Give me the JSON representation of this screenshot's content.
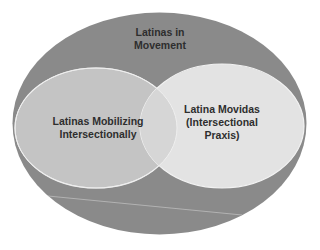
{
  "diagram": {
    "type": "nested-venn",
    "outer": {
      "lines": [
        "Latinas in",
        "Movement"
      ],
      "fill": "#8a8a8a"
    },
    "left": {
      "lines": [
        "Latinas Mobilizing",
        "Intersectionally"
      ],
      "fill": "#c4c4c4"
    },
    "right": {
      "lines": [
        "Latina Movidas",
        "(Intersectional",
        "Praxis)"
      ],
      "fill": "#e3e3e3"
    },
    "colors": {
      "background": "#ffffff",
      "outline": "#ececec",
      "text": "#2e2e2e",
      "divider_line": "#bdbdbd"
    }
  }
}
